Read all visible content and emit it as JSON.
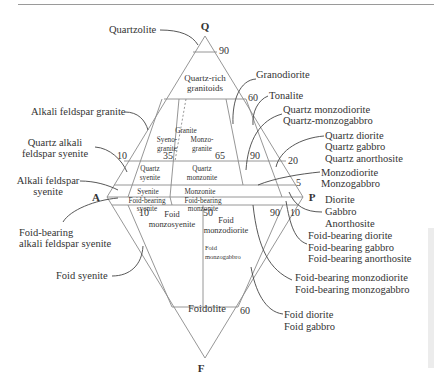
{
  "diagram": {
    "type": "QAPF double triangle (plutonic rock classification)",
    "vertices": {
      "Q": "Q",
      "A": "A",
      "P": "P",
      "F": "F"
    },
    "tick_numbers": {
      "q90": "90",
      "q60": "60",
      "q20": "20",
      "q5": "5",
      "r10": "10",
      "r35": "35",
      "r65": "65",
      "r90": "90",
      "f10_left": "10",
      "f50": "50",
      "f90": "90",
      "f10_right": "10",
      "f60": "60"
    },
    "fields": {
      "quartzolite_inner": "",
      "quartz_rich_1": "Quartz-rich",
      "quartz_rich_2": "granitoids",
      "granite": "Granite",
      "syeno_1": "Syeno-",
      "syeno_2": "granite",
      "monzo_1": "Monzo-",
      "monzo_2": "granite",
      "quartz_syenite_1": "Quartz",
      "quartz_syenite_2": "syenite",
      "quartz_monzonite_1": "Quartz",
      "quartz_monzonite_2": "monzonite",
      "syenite": "Syenite",
      "monzonite": "Monzonite",
      "fb_syenite_1": "Foid-bearing",
      "fb_syenite_2": "syenite",
      "fb_monzonite_1": "Foid-bearing",
      "fb_monzonite_2": "monzonite",
      "foid_monzosyenite_1": "Foid",
      "foid_monzosyenite_2": "monzosyenite",
      "foid_monzodiorite_1": "Foid",
      "foid_monzodiorite_2": "monzodiorite",
      "foid_monzogabbro_1": "Foid",
      "foid_monzogabbro_2": "monzogabbro",
      "foidolite": "Foidolite"
    },
    "callouts_left": {
      "quartzolite": "Quartzolite",
      "alkali_feldspar_granite": "Alkali feldspar granite",
      "quartz_alkali_1": "Quartz alkali",
      "quartz_alkali_2": "feldspar syenite",
      "alkali_feldspar_1": "Alkali feldspar",
      "alkali_feldspar_2": "syenite",
      "fb_alkali_1": "Foid-bearing",
      "fb_alkali_2": "alkali feldspar syenite",
      "foid_syenite": "Foid syenite"
    },
    "callouts_right": {
      "granodiorite": "Granodiorite",
      "tonalite": "Tonalite",
      "qmd_1": "Quartz monzodiorite",
      "qmd_2": "Quartz-monzogabbro",
      "qd_1": "Quartz diorite",
      "qd_2": "Quartz gabbro",
      "qd_3": "Quartz anorthosite",
      "md_1": "Monzodiorite",
      "md_2": "Monzogabbro",
      "dio_1": "Diorite",
      "dio_2": "Gabbro",
      "dio_3": "Anorthosite",
      "fbd_1": "Foid-bearing diorite",
      "fbd_2": "Foid-bearing gabbro",
      "fbd_3": "Foid-bearing anorthosite",
      "fbmd_1": "Foid-bearing monzodiorite",
      "fbmd_2": "Foid-bearing monzogabbro",
      "fd_1": "Foid diorite",
      "fd_2": "Foid gabbro"
    },
    "colors": {
      "line": "#8a8a8a",
      "text": "#333333",
      "leader": "#444444"
    }
  }
}
